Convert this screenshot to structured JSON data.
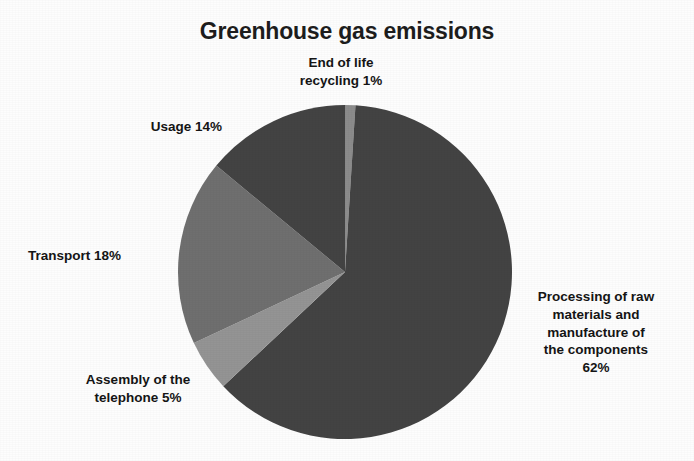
{
  "chart_data": {
    "type": "pie",
    "title": "Greenhouse gas emissions",
    "xlabel": "",
    "ylabel": "",
    "legend_position": "none",
    "grid": false,
    "units": "percent",
    "categories": [
      "Processing of raw materials and manufacture of the components",
      "End of life recycling",
      "Usage",
      "Transport",
      "Assembly of the telephone"
    ],
    "values": [
      62,
      1,
      14,
      18,
      5
    ],
    "colors": [
      "#434343",
      "#8c8c8c",
      "#434343",
      "#6f6f6f",
      "#949494"
    ],
    "slices": [
      {
        "name": "processing-of-raw-materials",
        "label": "Processing of raw\nmaterials and\nmanufacture of\nthe components\n62%",
        "value": 62,
        "color": "#434343",
        "start_angle": 3.6,
        "end_angle": 226.8
      },
      {
        "name": "assembly-of-the-telephone",
        "label": "Assembly of the\ntelephone 5%",
        "value": 5,
        "color": "#949494",
        "start_angle": 226.8,
        "end_angle": 244.8
      },
      {
        "name": "transport",
        "label": "Transport 18%",
        "value": 18,
        "color": "#6f6f6f",
        "start_angle": 244.8,
        "end_angle": 309.6
      },
      {
        "name": "usage",
        "label": "Usage 14%",
        "value": 14,
        "color": "#434343",
        "start_angle": 309.6,
        "end_angle": 360.0
      },
      {
        "name": "end-of-life-recycling",
        "label": "End of life\nrecycling 1%",
        "value": 1,
        "color": "#8c8c8c",
        "start_angle": 0.0,
        "end_angle": 3.6
      }
    ]
  },
  "chart": {
    "title": "Greenhouse gas emissions",
    "labels": {
      "end_of_life": "End of life\nrecycling 1%",
      "usage": "Usage 14%",
      "transport": "Transport 18%",
      "assembly": "Assembly of the\ntelephone 5%",
      "processing": "Processing of raw\nmaterials and\nmanufacture of\nthe components\n62%"
    }
  }
}
